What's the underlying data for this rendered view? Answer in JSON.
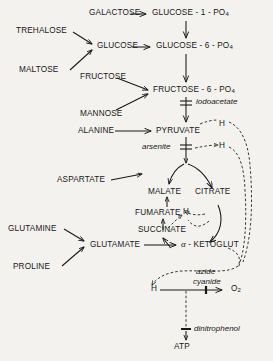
{
  "diagram": {
    "background_color": "#f4f2ee",
    "ink_color": "#18181a"
  },
  "nodes": {
    "galactose": "GALACTOSE",
    "glucose_1_po4": "GLUCOSE - 1 - PO",
    "glucose_1_po4_sub": "4",
    "trehalose": "TREHALOSE",
    "maltose": "MALTOSE",
    "glucose": "GLUCOSE",
    "glucose_6_po4": "GLUCOSE - 6 - PO",
    "glucose_6_po4_sub": "4",
    "fructose": "FRUCTOSE",
    "mannose": "MANNOSE",
    "fructose_6_po4": "FRUCTOSE - 6 - PO",
    "fructose_6_po4_sub": "4",
    "alanine": "ALANINE",
    "pyruvate": "PYRUVATE",
    "aspartate": "ASPARTATE",
    "malate": "MALATE",
    "fumarate": "FUMARATE",
    "succinate": "SUCCINATE",
    "citrate": "CITRATE",
    "alpha_symbol": "α",
    "ketoglutarate": "- KETOGLUT",
    "glutamine": "GLUTAMINE",
    "proline": "PROLINE",
    "glutamate": "GLUTAMATE",
    "hydrogen_terminal": "H",
    "oxygen": "O",
    "oxygen_sub": "2",
    "atp": "ATP"
  },
  "carriers": {
    "h_pyruvate_1": "H",
    "h_pyruvate_2": "H",
    "h_tca": "H"
  },
  "inhibitors": {
    "iodoacetate": "iodoacetate",
    "arsenite": "arsenite",
    "azide": "azide",
    "cyanide": "cyanide",
    "dinitrophenol": "dinitrophenol"
  }
}
